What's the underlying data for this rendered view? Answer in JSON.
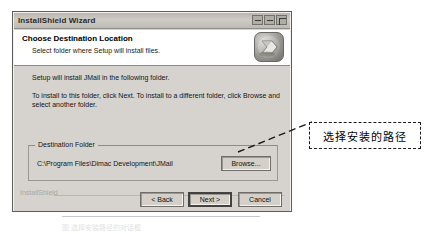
{
  "dialog": {
    "title": "InstallShield Wizard",
    "window_controls": [
      {
        "name": "minimize",
        "glyph": "_"
      },
      {
        "name": "maximize",
        "glyph": "□"
      },
      {
        "name": "close",
        "glyph": "×"
      }
    ],
    "header": {
      "title": "Choose Destination Location",
      "subtitle": "Select folder where Setup will install files.",
      "logo_icon": "installshield-logo-icon"
    },
    "body": {
      "line1": "Setup will install JMail in the following folder.",
      "line2": "To install to this folder, click Next. To install to a different folder, click Browse and select another folder."
    },
    "destination": {
      "group_label": "Destination Folder",
      "path": "C:\\Program Files\\Dimac Development\\JMail",
      "browse_label": "Browse..."
    },
    "watermark": "InstallShield",
    "buttons": {
      "back": "< Back",
      "next": "Next >",
      "cancel": "Cancel"
    }
  },
  "annotation": {
    "callout_text": "选择安装的路径"
  },
  "caption": {
    "text": "图 选择安装路径的对话框"
  },
  "colors": {
    "dialog_face": "#d6d3ce",
    "header_band": "#ffffff",
    "page_background": "#ffffff",
    "annotation_border": "#1a1a1a"
  }
}
